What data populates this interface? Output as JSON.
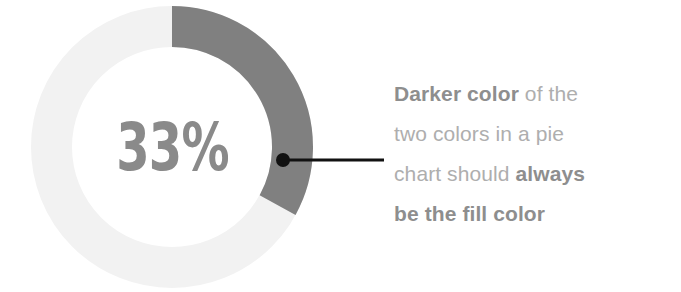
{
  "chart_data": {
    "type": "pie",
    "variant": "donut",
    "title": "",
    "subtitle": "",
    "xlabel": "",
    "ylabel": "",
    "grid": false,
    "legend_position": "none",
    "center_label": "33%",
    "start_angle_deg": 0,
    "direction": "clockwise",
    "inner_radius_ratio": 0.7,
    "slices": [
      {
        "name": "Filled",
        "value": 33,
        "unit": "%",
        "color": "#808080",
        "role": "fill-color"
      },
      {
        "name": "Remainder",
        "value": 67,
        "unit": "%",
        "color": "#f2f2f2",
        "role": "track-color"
      }
    ],
    "categories": [
      "Filled",
      "Remainder"
    ],
    "values": [
      33,
      67
    ],
    "annotation": {
      "target_slice": "Filled",
      "connector": "line-with-dot",
      "connector_color": "#111111",
      "lines": [
        {
          "parts": [
            {
              "text": "Darker color",
              "bold": true
            },
            {
              "text": " of the",
              "bold": false
            }
          ]
        },
        {
          "parts": [
            {
              "text": "two colors in a pie",
              "bold": false
            }
          ]
        },
        {
          "parts": [
            {
              "text": "chart should ",
              "bold": false
            },
            {
              "text": "always",
              "bold": true
            }
          ]
        },
        {
          "parts": [
            {
              "text": "be the fill color",
              "bold": true
            }
          ]
        }
      ],
      "plain_text": "Darker color of the two colors in a pie chart should always be the fill color"
    }
  },
  "colors": {
    "fill_dark": "#808080",
    "track_light": "#f2f2f2",
    "center_text": "#8a8a8a",
    "annotation_bold": "#8e8e8e",
    "annotation_regular": "#aeaeae",
    "connector": "#111111",
    "background": "#ffffff"
  }
}
